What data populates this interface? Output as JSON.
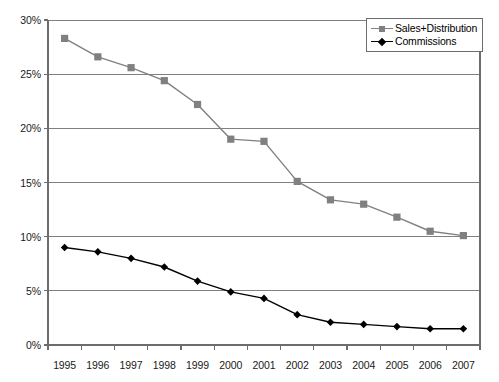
{
  "chart_data": {
    "type": "line",
    "title": "",
    "xlabel": "",
    "ylabel": "",
    "categories": [
      "1995",
      "1996",
      "1997",
      "1998",
      "1999",
      "2000",
      "2001",
      "2002",
      "2003",
      "2004",
      "2005",
      "2006",
      "2007"
    ],
    "ylim": [
      0,
      30
    ],
    "ytick_values": [
      0,
      5,
      10,
      15,
      20,
      25,
      30
    ],
    "ytick_labels": [
      "0%",
      "5%",
      "10%",
      "15%",
      "20%",
      "25%",
      "30%"
    ],
    "grid": "horizontal",
    "legend_position": "top-right",
    "series": [
      {
        "name": "Sales+Distribution",
        "color": "#808080",
        "marker": "square",
        "values": [
          28.3,
          26.6,
          25.6,
          24.4,
          22.2,
          19.0,
          18.8,
          15.1,
          13.4,
          13.0,
          11.8,
          10.5,
          10.1
        ]
      },
      {
        "name": "Commissions",
        "color": "#000000",
        "marker": "diamond",
        "values": [
          9.0,
          8.6,
          8.0,
          7.2,
          5.9,
          4.9,
          4.3,
          2.8,
          2.1,
          1.9,
          1.7,
          1.5,
          1.5
        ]
      }
    ]
  },
  "legend": {
    "items": [
      {
        "label": "Sales+Distribution"
      },
      {
        "label": "Commissions"
      }
    ]
  },
  "colors": {
    "sales_series": "#808080",
    "commissions_series": "#000000",
    "gridline": "#808080",
    "axis": "#6d6d6d",
    "text": "#1a1a1a",
    "background": "#ffffff"
  }
}
